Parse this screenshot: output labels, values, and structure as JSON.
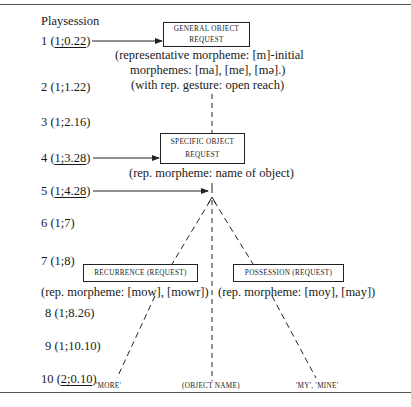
{
  "axis": {
    "title": "Playsession",
    "sessions": [
      {
        "num": "1",
        "open": "(",
        "age": "1;0.22",
        "close": ")",
        "underlined": true
      },
      {
        "num": "2",
        "open": "(",
        "age": "1;1.22",
        "close": ")",
        "underlined": false
      },
      {
        "num": "3",
        "open": "(",
        "age": "1;2.16",
        "close": ")",
        "underlined": false
      },
      {
        "num": "4",
        "open": "(",
        "age": "1;3.28",
        "close": ")",
        "underlined": true
      },
      {
        "num": "5",
        "open": "(",
        "age": "1;4.28",
        "close": ")",
        "underlined": true
      },
      {
        "num": "6",
        "open": "(",
        "age": "1;7",
        "close": ")",
        "underlined": false
      },
      {
        "num": "7",
        "open": "(",
        "age": "1;8",
        "close": ")",
        "underlined": false
      },
      {
        "num": "8",
        "open": "(",
        "age": "1;8.26",
        "close": ")",
        "underlined": false
      },
      {
        "num": "9",
        "open": "(",
        "age": "1;10.10",
        "close": ")",
        "underlined": false
      },
      {
        "num": "10",
        "open": "(",
        "age": "2;0.10",
        "close": ")",
        "underlined": true
      }
    ]
  },
  "nodes": {
    "general": {
      "line1": "GENERAL OBJECT",
      "line2": "REQUEST",
      "note1": "(representative morpheme: [m]-initial",
      "note2": "morphemes: [ma], [me], [mə].)",
      "note3": "(with rep. gesture: open reach)"
    },
    "specific": {
      "line1": "SPECIFIC OBJECT",
      "line2": "REQUEST",
      "note1": "(rep. morpheme: name of object)"
    },
    "recurrence": {
      "label": "RECURRENCE (REQUEST)",
      "note1": "(rep. morpheme: [mow], [mowr])"
    },
    "possession": {
      "label": "POSSESSION (REQUEST)",
      "note1": "(rep. morpheme: [moy], [may])"
    }
  },
  "outcomes": {
    "more": "'MORE'",
    "object_name": "(OBJECT NAME)",
    "my_mine": "'MY', 'MINE'"
  },
  "colors": {
    "ink": "#1a1a1a",
    "rule": "#555555",
    "background": "#ffffff"
  }
}
